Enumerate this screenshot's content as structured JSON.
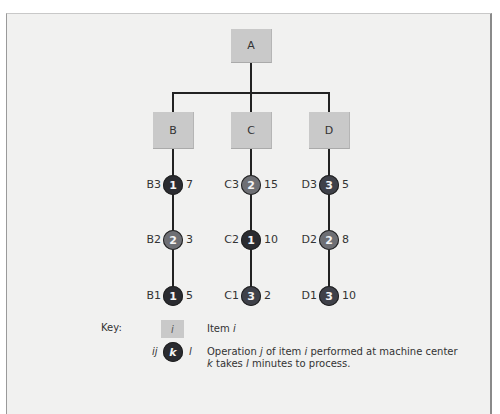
{
  "diagram": {
    "root": {
      "label": "A"
    },
    "children": [
      {
        "label": "B",
        "operations": [
          {
            "name": "B3",
            "machine": "1",
            "minutes": "7"
          },
          {
            "name": "B2",
            "machine": "2",
            "minutes": "3"
          },
          {
            "name": "B1",
            "machine": "1",
            "minutes": "5"
          }
        ]
      },
      {
        "label": "C",
        "operations": [
          {
            "name": "C3",
            "machine": "2",
            "minutes": "15"
          },
          {
            "name": "C2",
            "machine": "1",
            "minutes": "10"
          },
          {
            "name": "C1",
            "machine": "3",
            "minutes": "2"
          }
        ]
      },
      {
        "label": "D",
        "operations": [
          {
            "name": "D3",
            "machine": "3",
            "minutes": "5"
          },
          {
            "name": "D2",
            "machine": "2",
            "minutes": "8"
          },
          {
            "name": "D1",
            "machine": "3",
            "minutes": "10"
          }
        ]
      }
    ],
    "machine_colors": {
      "1": "#2a2b30",
      "2": "#6e6f74",
      "3": "#3f4149"
    }
  },
  "key": {
    "title": "Key:",
    "item_symbol": "i",
    "item_text_prefix": "Item ",
    "item_text_var": "i",
    "op_left": "ij",
    "op_circle": "k",
    "op_right": "l",
    "op_line1_a": "Operation ",
    "op_line1_j": "j",
    "op_line1_b": " of item ",
    "op_line1_i": "i",
    "op_line1_c": " performed at machine center",
    "op_line2_k": "k",
    "op_line2_a": " takes ",
    "op_line2_l": "l",
    "op_line2_b": " minutes to process."
  }
}
